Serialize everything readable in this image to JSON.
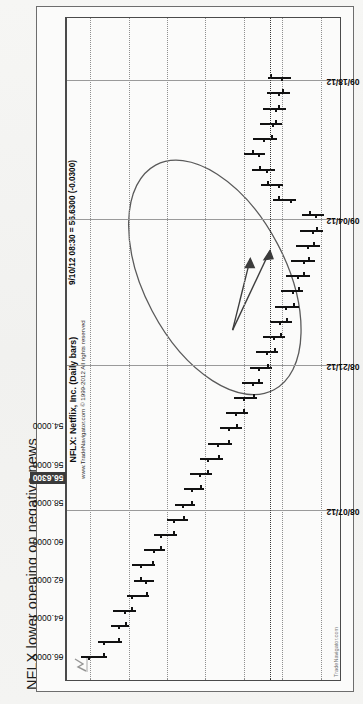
{
  "page": {
    "title": "NFLX lower opening on negative news",
    "background_color": "#f3f3f1",
    "orientation": "rotated-90-ccw"
  },
  "chart_panel": {
    "legend_line1": "NFLX: Netflix, Inc. (Daily bars)",
    "legend_line2": "www.TradeNavigator.com © 1999-2012 All rights reserved",
    "quote_readout": "9/10/12 08:30 = 56.6300 (-0.0300)",
    "watermark": "TradeNavigator.com",
    "logo_name": "trade-navigator-logo"
  },
  "chart_data": {
    "type": "bar",
    "subtype": "ohlc-price-bars",
    "title": "NFLX: Netflix, Inc. (Daily bars)",
    "subtitle": "NFLX lower opening on negative news",
    "xlabel": "",
    "ylabel": "",
    "grid": true,
    "legend_position": "top-center",
    "ylim": [
      53.0,
      67.2
    ],
    "y_ticks": [
      "66.0000",
      "64.0000",
      "62.0000",
      "60.0000",
      "58.0000",
      "56.0000",
      "54.0000"
    ],
    "y_tick_values": [
      66.0,
      64.0,
      62.0,
      60.0,
      58.0,
      56.0,
      54.0
    ],
    "highlighted_y_label": "56.6300",
    "highlighted_y_value": 56.63,
    "x_ticks": [
      "08/07/12",
      "08/21/12",
      "09/04/12",
      "09/18/12"
    ],
    "x_tick_positions": [
      0.255,
      0.475,
      0.695,
      0.905
    ],
    "xlim_labels": [
      "07/27/12",
      "09/21/12"
    ],
    "annotations": [
      {
        "name": "ellipse-highlight",
        "type": "ellipse",
        "note": "circles the gap-down and recovery region"
      },
      {
        "name": "arrow-to-gap",
        "type": "arrow",
        "note": "points at lower opening bar"
      },
      {
        "name": "arrow-to-bar",
        "type": "arrow",
        "note": "points at the gap day"
      }
    ],
    "bars": [
      {
        "x": 0.035,
        "open": 66.1,
        "high": 66.45,
        "low": 65.1,
        "close": 65.35
      },
      {
        "x": 0.058,
        "open": 65.35,
        "high": 65.6,
        "low": 64.35,
        "close": 64.55
      },
      {
        "x": 0.081,
        "open": 64.55,
        "high": 64.9,
        "low": 63.95,
        "close": 64.2
      },
      {
        "x": 0.104,
        "open": 64.25,
        "high": 64.8,
        "low": 63.6,
        "close": 63.85
      },
      {
        "x": 0.127,
        "open": 63.85,
        "high": 64.1,
        "low": 62.95,
        "close": 63.1
      },
      {
        "x": 0.15,
        "open": 63.15,
        "high": 63.7,
        "low": 62.7,
        "close": 63.4
      },
      {
        "x": 0.173,
        "open": 63.4,
        "high": 63.8,
        "low": 62.6,
        "close": 62.8
      },
      {
        "x": 0.196,
        "open": 62.75,
        "high": 63.2,
        "low": 62.1,
        "close": 62.35
      },
      {
        "x": 0.219,
        "open": 62.35,
        "high": 62.7,
        "low": 61.5,
        "close": 61.7
      },
      {
        "x": 0.242,
        "open": 61.7,
        "high": 62.0,
        "low": 60.9,
        "close": 61.15
      },
      {
        "x": 0.265,
        "open": 61.2,
        "high": 61.6,
        "low": 60.55,
        "close": 60.75
      },
      {
        "x": 0.288,
        "open": 60.75,
        "high": 61.1,
        "low": 60.05,
        "close": 60.3
      },
      {
        "x": 0.311,
        "open": 60.35,
        "high": 60.8,
        "low": 59.65,
        "close": 59.9
      },
      {
        "x": 0.334,
        "open": 59.9,
        "high": 60.3,
        "low": 59.1,
        "close": 59.35
      },
      {
        "x": 0.357,
        "open": 59.4,
        "high": 59.85,
        "low": 58.6,
        "close": 58.85
      },
      {
        "x": 0.38,
        "open": 58.85,
        "high": 59.25,
        "low": 58.1,
        "close": 58.4
      },
      {
        "x": 0.403,
        "open": 58.45,
        "high": 58.95,
        "low": 57.8,
        "close": 58.05
      },
      {
        "x": 0.426,
        "open": 58.05,
        "high": 58.5,
        "low": 57.3,
        "close": 57.55
      },
      {
        "x": 0.449,
        "open": 57.6,
        "high": 58.1,
        "low": 57.0,
        "close": 57.25
      },
      {
        "x": 0.472,
        "open": 57.25,
        "high": 57.7,
        "low": 56.55,
        "close": 56.8
      },
      {
        "x": 0.495,
        "open": 56.85,
        "high": 57.35,
        "low": 56.2,
        "close": 56.45
      },
      {
        "x": 0.518,
        "open": 56.5,
        "high": 57.0,
        "low": 55.85,
        "close": 56.1
      },
      {
        "x": 0.541,
        "open": 56.15,
        "high": 56.65,
        "low": 55.5,
        "close": 55.8
      },
      {
        "x": 0.564,
        "open": 55.85,
        "high": 56.4,
        "low": 55.15,
        "close": 55.45
      },
      {
        "x": 0.587,
        "open": 55.5,
        "high": 56.05,
        "low": 54.9,
        "close": 55.2
      },
      {
        "x": 0.61,
        "open": 55.25,
        "high": 55.8,
        "low": 54.55,
        "close": 54.9
      },
      {
        "x": 0.633,
        "open": 54.95,
        "high": 55.55,
        "low": 54.3,
        "close": 54.65
      },
      {
        "x": 0.656,
        "open": 54.7,
        "high": 55.3,
        "low": 54.05,
        "close": 54.4
      },
      {
        "x": 0.679,
        "open": 54.45,
        "high": 55.1,
        "low": 53.9,
        "close": 54.25
      },
      {
        "x": 0.702,
        "open": 54.3,
        "high": 55.0,
        "low": 53.85,
        "close": 54.6
      },
      {
        "x": 0.725,
        "open": 55.6,
        "high": 56.5,
        "low": 55.3,
        "close": 56.2
      },
      {
        "x": 0.748,
        "open": 56.25,
        "high": 57.1,
        "low": 55.95,
        "close": 56.8
      },
      {
        "x": 0.771,
        "open": 56.85,
        "high": 57.6,
        "low": 56.4,
        "close": 57.2
      },
      {
        "x": 0.794,
        "open": 57.25,
        "high": 58.0,
        "low": 56.9,
        "close": 57.6
      },
      {
        "x": 0.817,
        "open": 57.0,
        "high": 57.55,
        "low": 56.3,
        "close": 56.6
      },
      {
        "x": 0.84,
        "open": 56.55,
        "high": 57.15,
        "low": 56.0,
        "close": 56.4
      },
      {
        "x": 0.863,
        "open": 56.4,
        "high": 57.0,
        "low": 55.8,
        "close": 56.2
      },
      {
        "x": 0.886,
        "open": 56.2,
        "high": 56.8,
        "low": 55.6,
        "close": 56.0
      },
      {
        "x": 0.909,
        "open": 56.05,
        "high": 56.75,
        "low": 55.55,
        "close": 56.63
      }
    ]
  }
}
